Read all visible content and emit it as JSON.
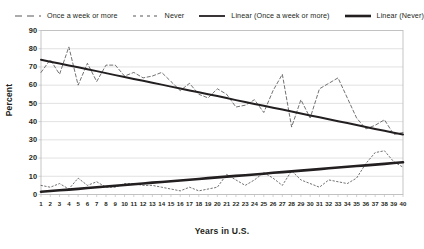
{
  "chart_data": {
    "type": "line",
    "title": "",
    "xlabel": "Years in U.S.",
    "ylabel": "Percent",
    "xlim": [
      1,
      40
    ],
    "ylim": [
      0,
      90
    ],
    "ytick_step": 10,
    "yticks": [
      0,
      10,
      20,
      30,
      40,
      50,
      60,
      70,
      80,
      90
    ],
    "x": [
      1,
      2,
      3,
      4,
      5,
      6,
      7,
      8,
      9,
      10,
      11,
      12,
      13,
      14,
      15,
      16,
      17,
      18,
      19,
      20,
      21,
      22,
      23,
      24,
      25,
      26,
      27,
      28,
      29,
      30,
      31,
      32,
      33,
      34,
      35,
      36,
      37,
      38,
      39,
      40
    ],
    "xticks": [
      "1",
      "2",
      "3",
      "4",
      "5",
      "6",
      "7",
      "8",
      "9",
      "10",
      "11",
      "12",
      "13",
      "14",
      "15",
      "16",
      "17",
      "18",
      "19",
      "20",
      "21",
      "22",
      "23",
      "24",
      "25",
      "26",
      "27",
      "28",
      "29",
      "30",
      "31",
      "32",
      "33",
      "34",
      "35",
      "36",
      "37",
      "38",
      "39",
      "40"
    ],
    "grid": true,
    "grid_axis": "y",
    "legend_position": "top",
    "series": [
      {
        "name": "Once a week or more",
        "style": "dashed",
        "values": [
          67,
          74,
          66,
          81,
          60,
          72,
          62,
          71,
          71,
          65,
          67,
          64,
          65,
          67,
          62,
          57,
          61,
          55,
          53,
          58,
          55,
          48,
          49,
          52,
          45,
          57,
          66,
          37,
          52,
          42,
          58,
          61,
          64,
          53,
          42,
          36,
          38,
          41,
          33,
          34
        ]
      },
      {
        "name": "Never",
        "style": "dotted",
        "values": [
          5,
          4,
          6,
          3,
          9,
          5,
          7,
          4,
          4,
          6,
          6,
          5,
          5,
          4,
          3,
          2,
          4,
          2,
          3,
          4,
          11,
          8,
          5,
          8,
          12,
          9,
          5,
          13,
          8,
          6,
          4,
          8,
          7,
          6,
          9,
          17,
          23,
          24,
          18,
          15
        ]
      },
      {
        "name": "Linear (Once a week or more)",
        "style": "solid-trend",
        "values": [
          74,
          72.9,
          71.9,
          70.8,
          69.8,
          68.7,
          67.7,
          66.6,
          65.5,
          64.5,
          63.4,
          62.4,
          61.3,
          60.3,
          59.2,
          58.2,
          57.1,
          56.1,
          55.0,
          54.0,
          52.9,
          51.8,
          50.8,
          49.7,
          48.7,
          47.6,
          46.6,
          45.5,
          44.5,
          43.4,
          42.4,
          41.3,
          40.2,
          39.2,
          38.1,
          37.1,
          36.0,
          35.0,
          33.9,
          32.9
        ],
        "intercept": 74,
        "slope": -1.054,
        "endpoints": [
          74,
          33
        ]
      },
      {
        "name": "Linear (Never)",
        "style": "solid-trend-thick",
        "values": [
          1.5,
          1.9,
          2.3,
          2.7,
          3.1,
          3.6,
          4.0,
          4.4,
          4.8,
          5.2,
          5.6,
          6.0,
          6.5,
          6.9,
          7.3,
          7.7,
          8.1,
          8.5,
          9.0,
          9.4,
          9.8,
          10.2,
          10.6,
          11.0,
          11.4,
          11.9,
          12.3,
          12.7,
          13.1,
          13.5,
          13.9,
          14.4,
          14.8,
          15.2,
          15.6,
          16.0,
          16.4,
          16.8,
          17.3,
          17.7
        ],
        "intercept": 1.5,
        "slope": 0.4154,
        "endpoints": [
          1.5,
          17.7
        ]
      }
    ],
    "colors": {
      "series_once_a_week": "#58595b",
      "series_never": "#58595b",
      "trend_once_a_week": "#231f20",
      "trend_never": "#231f20",
      "grid": "#d9d9d9",
      "axis": "#bfbfbf",
      "text": "#231f20",
      "background": "#ffffff"
    }
  },
  "legend": {
    "items": [
      {
        "label": "Once a week or more",
        "key": "dashed-line-key"
      },
      {
        "label": "Never",
        "key": "dotted-line-key"
      },
      {
        "label": "Linear (Once a week or more)",
        "key": "solid-line-key"
      },
      {
        "label": "Linear (Never)",
        "key": "thick-solid-line-key"
      }
    ]
  },
  "axes": {
    "y_title": "Percent",
    "x_title": "Years in U.S."
  }
}
